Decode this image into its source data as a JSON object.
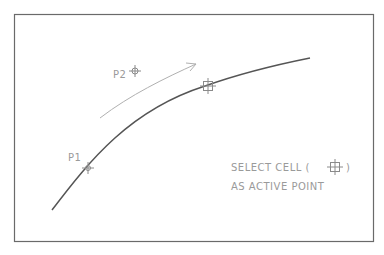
{
  "frame": {
    "x": 14,
    "y": 14,
    "w": 360,
    "h": 228,
    "stroke": "#6a6a6a"
  },
  "curve": {
    "path": "M52,210 C90,160 130,110 205,86 C250,70 290,62 310,58",
    "stroke": "#555555"
  },
  "arrow": {
    "path": "M100,118 C130,95 165,78 196,64",
    "stroke": "#b0b0b0"
  },
  "points": [
    {
      "label": "P1",
      "x": 88,
      "y": 168,
      "label_x": 68,
      "label_y": 161
    },
    {
      "label": "P2",
      "x": 135,
      "y": 70,
      "label_x": 113,
      "label_y": 78
    },
    {
      "label": "",
      "x": 208,
      "y": 86
    }
  ],
  "annotation": {
    "line1": "SELECT CELL (",
    "line1_end": ")",
    "line2": "AS ACTIVE POINT"
  },
  "colors": {
    "text": "#9a9a9a",
    "marker": "#8a8a8a"
  }
}
